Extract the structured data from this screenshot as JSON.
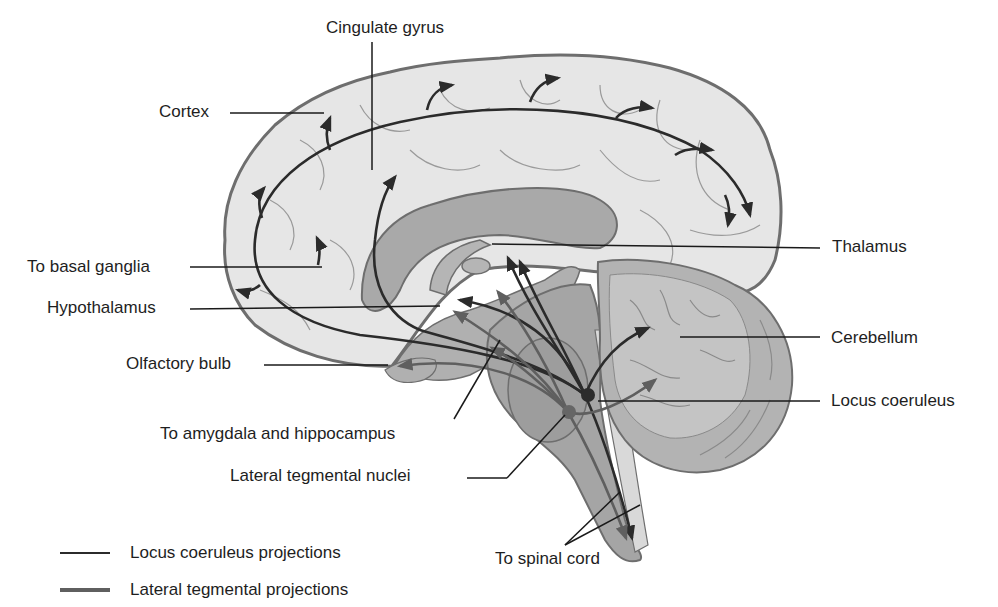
{
  "diagram": {
    "colors": {
      "background": "#ffffff",
      "cortex_fill": "#e6e6e6",
      "cortex_outline": "#6e6e6e",
      "corpus_callosum": "#a9a9a9",
      "brainstem_fill": "#a5a5a5",
      "cerebellum_fill": "#b3b3b3",
      "locus_coeruleus_line": "#2b2b2b",
      "lateral_tegmental_line": "#5f5f5f",
      "leader_line": "#1a1a1a"
    },
    "labels": {
      "cingulate_gyrus": "Cingulate gyrus",
      "cortex": "Cortex",
      "thalamus": "Thalamus",
      "to_basal_ganglia": "To basal ganglia",
      "hypothalamus": "Hypothalamus",
      "cerebellum": "Cerebellum",
      "olfactory_bulb": "Olfactory bulb",
      "locus_coeruleus": "Locus coeruleus",
      "to_amygdala_hippocampus": "To amygdala and hippocampus",
      "lateral_tegmental_nuclei": "Lateral tegmental nuclei",
      "to_spinal_cord": "To spinal cord"
    },
    "legend": [
      {
        "label": "Locus coeruleus projections",
        "color": "#2b2b2b"
      },
      {
        "label": "Lateral tegmental projections",
        "color": "#5f5f5f"
      }
    ]
  }
}
